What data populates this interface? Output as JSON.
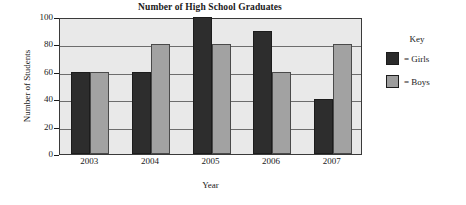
{
  "chart_data": {
    "type": "bar",
    "title": "Number of High School Graduates",
    "xlabel": "Year",
    "ylabel": "Number of Students",
    "categories": [
      "2003",
      "2004",
      "2005",
      "2006",
      "2007"
    ],
    "series": [
      {
        "name": "Girls",
        "color": "#2d2d2d",
        "values": [
          60,
          60,
          100,
          90,
          40
        ]
      },
      {
        "name": "Boys",
        "color": "#a2a2a2",
        "values": [
          60,
          80,
          80,
          60,
          80
        ]
      }
    ],
    "ylim": [
      0,
      100
    ],
    "yticks": [
      0,
      20,
      40,
      60,
      80,
      100
    ],
    "ytick_labels": [
      "0",
      "20",
      "40",
      "60",
      "80",
      "100"
    ],
    "grid": true,
    "legend_position": "right",
    "legend": {
      "title": "Key",
      "entries": [
        {
          "label": "= Girls",
          "swatch": "girls"
        },
        {
          "label": "= Boys",
          "swatch": "boys"
        }
      ]
    },
    "plot_background": "#e9e9e9",
    "gridline_color": "#6d6d6d",
    "axis_color": "#3a3a3a"
  }
}
